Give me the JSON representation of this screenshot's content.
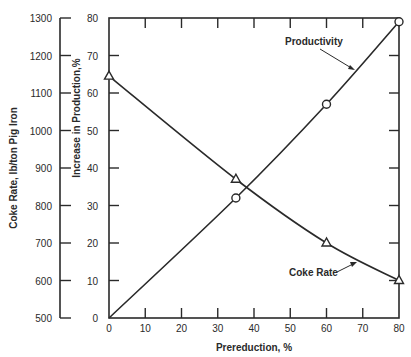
{
  "chart_data": {
    "type": "line",
    "title": "",
    "xlabel": "Prereduction, %",
    "ylabel_left": "Coke Rate, lb/ton Pig Iron",
    "ylabel_right_inner": "Increase in Production,%",
    "xlim": [
      0,
      80
    ],
    "x_ticks": [
      0,
      10,
      20,
      30,
      40,
      50,
      60,
      70,
      80
    ],
    "ylim_coke": [
      500,
      1300
    ],
    "coke_ticks": [
      500,
      600,
      700,
      800,
      900,
      1000,
      1100,
      1200,
      1300
    ],
    "ylim_production": [
      0,
      80
    ],
    "production_ticks": [
      0,
      10,
      20,
      30,
      40,
      50,
      60,
      70,
      80
    ],
    "grid": false,
    "series": [
      {
        "name": "Coke Rate",
        "axis": "coke",
        "marker": "triangle",
        "x": [
          0,
          35,
          60,
          80
        ],
        "values": [
          1145,
          870,
          700,
          600
        ]
      },
      {
        "name": "Productivity",
        "axis": "production",
        "marker": "circle",
        "x": [
          0,
          35,
          60,
          80
        ],
        "values": [
          0,
          32,
          57,
          79
        ]
      }
    ],
    "annotations": [
      {
        "text": "Productivity",
        "points_to_series": "Productivity"
      },
      {
        "text": "Coke Rate",
        "points_to_series": "Coke Rate"
      }
    ]
  },
  "colors": {
    "ink": "#2a2a2a",
    "background": "#ffffff"
  }
}
